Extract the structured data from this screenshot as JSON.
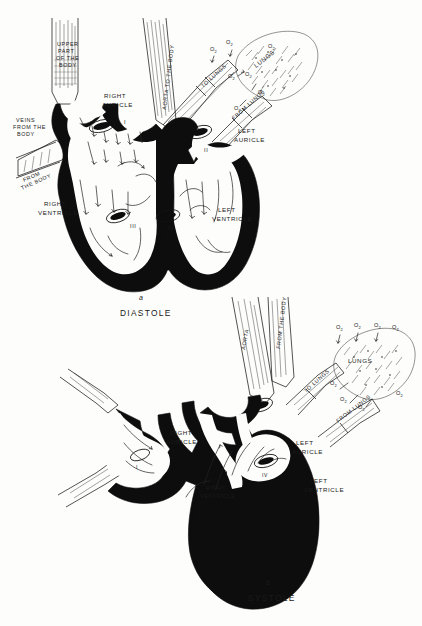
{
  "page": {
    "background_color": "#fdfdfc",
    "ink_color": "#0d0d0d"
  },
  "figures": [
    {
      "id": "diastole",
      "caption_letter": "a",
      "caption_name": "DIASTOLE",
      "labels": {
        "upper_body": "UPPER\nPART\nOF THE\nBODY",
        "upper_body_flat": "UPPER PART OF THE BODY",
        "veins_from_body": "VEINS\nFROM THE\nBODY",
        "veins_from_body_flat": "VEINS FROM THE BODY",
        "lower_body": "FROM\nTHE BODY",
        "aorta": "AORTA TO THE BODY",
        "to_lungs": "TO LUNGS",
        "from_lungs": "FROM LUNGS",
        "lungs": "LUNGS",
        "right_auricle": "RIGHT\nAURICLE",
        "right_auricle_l1": "RIGHT",
        "right_auricle_l2": "AURICLE",
        "left_auricle_l1": "LEFT",
        "left_auricle_l2": "AURICLE",
        "right_ventricle_l1": "RIGHT",
        "right_ventricle_l2": "VENTRICLE",
        "left_ventricle_l1": "LEFT",
        "left_ventricle_l2": "VENTRICLE"
      },
      "oxygen_labels": [
        "O₂",
        "O₂",
        "O₂",
        "O₂",
        "O₂",
        "O₂",
        "O₂"
      ],
      "valve_numerals": [
        "I",
        "II",
        "III",
        "IV"
      ]
    },
    {
      "id": "systole",
      "caption_letter": "b",
      "caption_name": "SYSTOLE",
      "labels": {
        "aorta": "AORTA",
        "from_the_body": "FROM THE BODY",
        "to_lungs": "TO LUNGS",
        "from_lungs": "FROM LUNGS",
        "lungs": "LUNGS",
        "right_auricle_l1": "RIGHT",
        "right_auricle_l2": "AURICLE",
        "left_auricle_l1": "LEFT",
        "left_auricle_l2": "AURICLE",
        "right_ventricle_l1": "RIGHT",
        "right_ventricle_l2": "VENTRICLE",
        "left_ventricle_l1": "LEFT",
        "left_ventricle_l2": "VENTRICLE"
      },
      "oxygen_labels": [
        "O₂",
        "O₂",
        "O₂",
        "O₂",
        "O₂",
        "O₂",
        "O₂"
      ],
      "valve_numerals": [
        "I",
        "II",
        "III",
        "IV"
      ]
    }
  ]
}
